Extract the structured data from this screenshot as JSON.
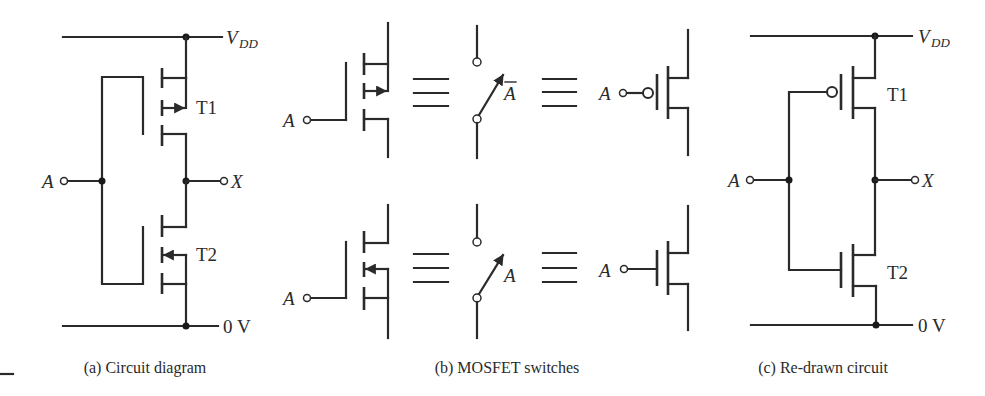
{
  "figure": {
    "panel_a": {
      "caption": "(a) Circuit diagram",
      "supply_label_main": "V",
      "supply_label_sub": "DD",
      "ground_label": "0 V",
      "input_label": "A",
      "output_label": "X",
      "transistor_top": "T1",
      "transistor_bottom": "T2"
    },
    "panel_b": {
      "caption": "(b) MOSFET switches",
      "top_row": {
        "input_label": "A",
        "switch_control_label": "A",
        "switch_control_overbar": true,
        "symbol_input_label": "A",
        "device": "p-channel MOSFET"
      },
      "bottom_row": {
        "input_label": "A",
        "switch_control_label": "A",
        "symbol_input_label": "A",
        "device": "n-channel MOSFET"
      },
      "equivalence_symbol": "≡"
    },
    "panel_c": {
      "caption": "(c) Re-drawn circuit",
      "supply_label_main": "V",
      "supply_label_sub": "DD",
      "ground_label": "0 V",
      "input_label": "A",
      "output_label": "X",
      "transistor_top": "T1",
      "transistor_bottom": "T2"
    }
  },
  "colors": {
    "line": "#2a2a2a",
    "background": "#ffffff"
  }
}
